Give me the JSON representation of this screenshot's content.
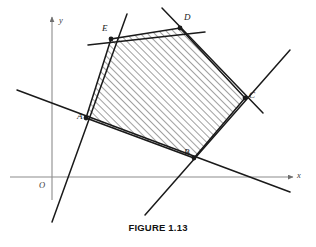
{
  "figure": {
    "caption": "FIGURE 1.13",
    "axes": {
      "x_label": "x",
      "y_label": "y",
      "origin_label": "O",
      "axis_color": "#8c8c8c",
      "x_axis_y": 177,
      "y_axis_x": 52,
      "x_axis_from": 10,
      "x_axis_to": 293,
      "y_axis_from": 17,
      "y_axis_to": 200
    },
    "line_color": "#1a1a1a",
    "hatch_color": "#2b2b2b",
    "points": [
      {
        "label": "A",
        "x": 86,
        "y": 118,
        "label_dx": -9,
        "label_dy": 3
      },
      {
        "label": "B",
        "x": 194,
        "y": 158,
        "label_dx": -10,
        "label_dy": -1
      },
      {
        "label": "C",
        "x": 245,
        "y": 98,
        "label_dx": 4,
        "label_dy": 2
      },
      {
        "label": "D",
        "x": 180,
        "y": 28,
        "label_dx": 4,
        "label_dy": -6
      },
      {
        "label": "E",
        "x": 111,
        "y": 39,
        "label_dx": -9,
        "label_dy": -6
      }
    ],
    "region": {
      "name": "shaded-pentagon",
      "vertices": "86,118 111,39 180,28 245,98 194,158"
    },
    "lines": [
      {
        "name": "line-through-A-and-B",
        "x1": 17,
        "y1": 90,
        "x2": 290,
        "y2": 192
      },
      {
        "name": "line-through-A-and-E",
        "x1": 52,
        "y1": 222,
        "x2": 127,
        "y2": 14
      },
      {
        "name": "line-through-E-and-D",
        "x1": 88,
        "y1": 45,
        "x2": 205,
        "y2": 32
      },
      {
        "name": "line-through-D-and-C",
        "x1": 162,
        "y1": 8,
        "x2": 263,
        "y2": 113
      },
      {
        "name": "line-through-B-and-C",
        "x1": 145,
        "y1": 215,
        "x2": 290,
        "y2": 50
      }
    ]
  }
}
